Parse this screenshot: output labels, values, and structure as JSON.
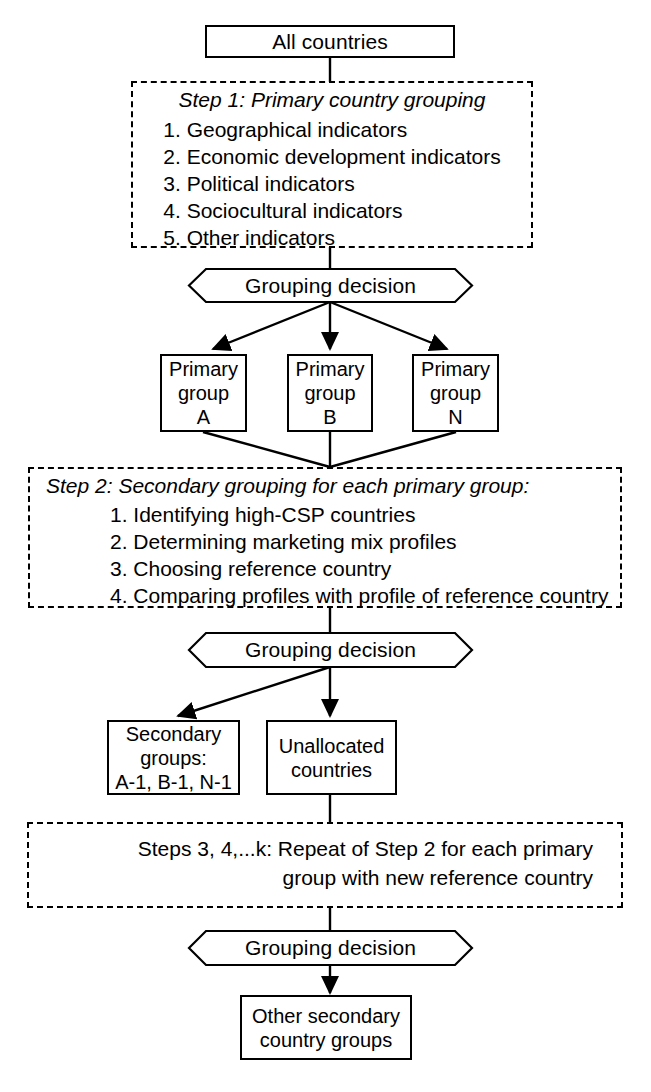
{
  "diagram": {
    "line_color": "#000000",
    "background": "#ffffff"
  },
  "nodes": {
    "all_countries": {
      "label": "All countries"
    },
    "step1": {
      "title": "Step 1: Primary country grouping",
      "items": [
        "1. Geographical indicators",
        "2. Economic development indicators",
        "3. Political indicators",
        "4. Sociocultural indicators",
        "5. Other indicators"
      ]
    },
    "decision1": {
      "label": "Grouping decision"
    },
    "primary_group_a": {
      "line1": "Primary",
      "line2": "group",
      "line3": "A"
    },
    "primary_group_b": {
      "line1": "Primary",
      "line2": "group",
      "line3": "B"
    },
    "primary_group_n": {
      "line1": "Primary",
      "line2": "group",
      "line3": "N"
    },
    "step2": {
      "title": "Step 2: Secondary grouping for each primary group:",
      "items": [
        "1. Identifying high-CSP countries",
        "2. Determining marketing mix profiles",
        "3. Choosing reference country",
        "4. Comparing profiles with profile of reference country"
      ]
    },
    "decision2": {
      "label": "Grouping decision"
    },
    "secondary_groups": {
      "line1": "Secondary",
      "line2": "groups:",
      "line3": "A-1, B-1, N-1"
    },
    "unallocated": {
      "line1": "Unallocated",
      "line2": "countries"
    },
    "steps_repeat": {
      "line1": "Steps 3, 4,...k: Repeat of Step 2 for each primary",
      "line2": "group with new reference country"
    },
    "decision3": {
      "label": "Grouping decision"
    },
    "other_secondary": {
      "line1": "Other secondary",
      "line2": "country groups"
    }
  }
}
